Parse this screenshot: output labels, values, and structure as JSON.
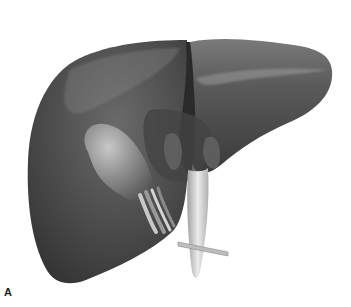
{
  "figure": {
    "panel_label": "A",
    "colors": {
      "background": "#ffffff",
      "liver_dark": "#3a3a3a",
      "liver_mid": "#5c5c5c",
      "liver_light": "#8a8a8a",
      "gallbladder": "#9a9a9a",
      "ligament": "#d8d8d8",
      "probe": "#bdbdbd"
    }
  }
}
